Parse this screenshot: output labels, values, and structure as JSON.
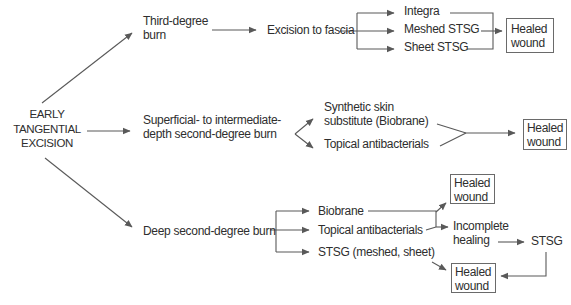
{
  "colors": {
    "background": "#ffffff",
    "text": "#2e2e2e",
    "line": "#595959",
    "box_border": "#6a6a6a"
  },
  "root": {
    "label": "EARLY\nTANGENTIAL\nEXCISION"
  },
  "branch1": {
    "condition": "Third-degree\nburn",
    "procedure": "Excision to fascia",
    "option1": "Integra",
    "option2": "Meshed STSG",
    "option3": "Sheet STSG",
    "outcome": "Healed\nwound"
  },
  "branch2": {
    "condition": "Superficial- to intermediate-\ndepth second-degree burn",
    "option1": "Synthetic skin\nsubstitute (Biobrane)",
    "option2": "Topical antibacterials",
    "outcome": "Healed\nwound"
  },
  "branch3": {
    "condition": "Deep second-degree burn",
    "option1": "Biobrane",
    "option2": "Topical antibacterials",
    "option3": "STSG (meshed, sheet)",
    "outcome_healed": "Healed\nwound",
    "outcome_incomplete": "Incomplete\nhealing",
    "followup": "STSG",
    "final_outcome": "Healed\nwound"
  }
}
